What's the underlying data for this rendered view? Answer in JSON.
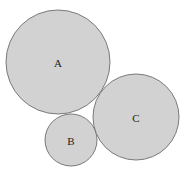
{
  "diagram": {
    "type": "tangent-circles",
    "background": "#ffffff",
    "fill_color": "#d2d2d2",
    "stroke_color": "#7a7a7a",
    "label_color": "#222222",
    "circles": [
      {
        "label": "A",
        "cx": 58,
        "cy": 62,
        "r": 52
      },
      {
        "label": "B",
        "cx": 71,
        "cy": 140,
        "r": 26
      },
      {
        "label": "C",
        "cx": 136,
        "cy": 117,
        "r": 43
      }
    ]
  }
}
